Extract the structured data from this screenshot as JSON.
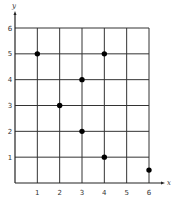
{
  "chart_data": {
    "type": "scatter",
    "title": "",
    "xlabel": "x",
    "ylabel": "y",
    "xlim": [
      0,
      6
    ],
    "ylim": [
      0,
      6
    ],
    "grid": true,
    "legend": null,
    "x_ticks": [
      "1",
      "2",
      "3",
      "4",
      "5",
      "6"
    ],
    "y_ticks": [
      "1",
      "2",
      "3",
      "4",
      "5",
      "6"
    ],
    "points": [
      {
        "x": 1,
        "y": 5
      },
      {
        "x": 2,
        "y": 3
      },
      {
        "x": 3,
        "y": 4
      },
      {
        "x": 3,
        "y": 2
      },
      {
        "x": 4,
        "y": 5
      },
      {
        "x": 4,
        "y": 1
      },
      {
        "x": 6,
        "y": 0.5
      }
    ],
    "colors": {
      "points": "#000000",
      "grid": "#333333"
    }
  }
}
